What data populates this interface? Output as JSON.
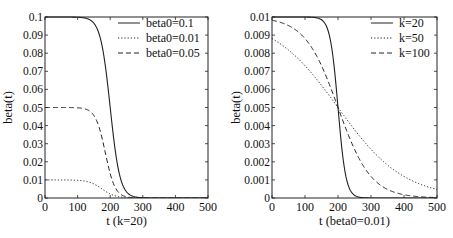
{
  "chart_data": [
    {
      "type": "line",
      "title": "",
      "xlabel": "t (k=20)",
      "ylabel": "beta(t)",
      "xlim": [
        0,
        500
      ],
      "ylim": [
        0,
        0.1
      ],
      "xticks": [
        "0",
        "100",
        "200",
        "300",
        "400",
        "500"
      ],
      "yticks": [
        "0",
        "0.01",
        "0.02",
        "0.03",
        "0.04",
        "0.05",
        "0.06",
        "0.07",
        "0.08",
        "0.09",
        "0.1"
      ],
      "legend_position": "upper right",
      "grid": false,
      "series": [
        {
          "name": "beta0=0.1",
          "style": "solid",
          "beta0": 0.1,
          "center": 200,
          "scale": 15,
          "x": [
            0,
            100,
            150,
            175,
            200,
            225,
            250,
            300,
            350,
            500
          ],
          "values": [
            0.1,
            0.0999,
            0.0966,
            0.0841,
            0.05,
            0.0159,
            0.0034,
            0.0001,
            0,
            0
          ]
        },
        {
          "name": "beta0=0.01",
          "style": "dotted",
          "beta0": 0.01,
          "center": 175,
          "scale": 20,
          "x": [
            0,
            100,
            150,
            175,
            200,
            250,
            300,
            350,
            500
          ],
          "values": [
            0.01,
            0.0098,
            0.0078,
            0.005,
            0.0022,
            0.0002,
            0,
            0,
            0
          ]
        },
        {
          "name": "beta0=0.05",
          "style": "dashed",
          "beta0": 0.05,
          "center": 185,
          "scale": 15,
          "x": [
            0,
            100,
            150,
            185,
            200,
            250,
            300,
            500
          ],
          "values": [
            0.05,
            0.05,
            0.0456,
            0.025,
            0.0134,
            0.0007,
            0,
            0
          ]
        }
      ]
    },
    {
      "type": "line",
      "title": "",
      "xlabel": "t (beta0=0.01)",
      "ylabel": "beta(t)",
      "xlim": [
        0,
        500
      ],
      "ylim": [
        0,
        0.01
      ],
      "xticks": [
        "0",
        "100",
        "200",
        "300",
        "400",
        "500"
      ],
      "yticks": [
        "0",
        "0.001",
        "0.002",
        "0.003",
        "0.004",
        "0.005",
        "0.006",
        "0.007",
        "0.008",
        "0.009",
        "0.01"
      ],
      "legend_position": "upper right",
      "grid": false,
      "series": [
        {
          "name": "k=20",
          "style": "solid",
          "beta0": 0.01,
          "center": 200,
          "scale": 12,
          "x": [
            0,
            100,
            150,
            200,
            250,
            300,
            500
          ],
          "values": [
            0.01,
            0.01,
            0.0098,
            0.005,
            0.0002,
            0,
            0
          ]
        },
        {
          "name": "k=50",
          "style": "dotted",
          "beta0": 0.01,
          "center": 200,
          "scale": 100,
          "x": [
            0,
            100,
            200,
            300,
            400,
            500
          ],
          "values": [
            0.0088,
            0.0073,
            0.005,
            0.0027,
            0.0012,
            0.0005
          ]
        },
        {
          "name": "k=100",
          "style": "dashed",
          "beta0": 0.01,
          "center": 200,
          "scale": 50,
          "x": [
            0,
            100,
            200,
            300,
            400,
            500
          ],
          "values": [
            0.0098,
            0.0088,
            0.005,
            0.0012,
            0.0002,
            0.0001
          ]
        }
      ]
    }
  ]
}
